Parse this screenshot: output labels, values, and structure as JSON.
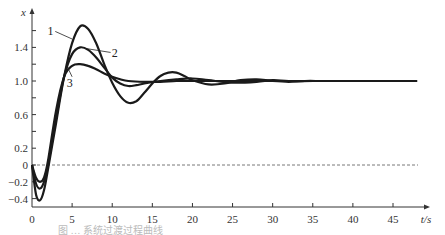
{
  "chart_data": {
    "type": "line",
    "title": "",
    "xlabel": "t/s",
    "ylabel": "x",
    "xlim": [
      0,
      48
    ],
    "ylim": [
      -0.5,
      1.85
    ],
    "x_ticks": [
      0,
      5,
      10,
      15,
      20,
      25,
      30,
      35,
      40,
      45
    ],
    "y_ticks": [
      -0.4,
      -0.2,
      0,
      0.2,
      0.6,
      1.0,
      1.4
    ],
    "y_tick_labels": [
      "-0.4",
      "-0.2",
      "0",
      "0.2",
      "0.6",
      "1.0",
      "1.4"
    ],
    "grid": false,
    "reference_line": {
      "y": 0,
      "style": "dashed"
    },
    "legend": "inline labels 1, 2, 3",
    "series": [
      {
        "name": "1",
        "x": [
          0,
          0.5,
          1,
          1.5,
          2,
          3,
          4,
          5,
          6,
          7,
          8,
          9,
          10,
          11,
          12,
          13,
          14,
          15,
          16,
          17,
          18,
          19,
          20,
          22,
          24,
          26,
          28,
          30,
          32,
          34,
          36,
          38,
          40,
          45,
          48
        ],
        "values": [
          0,
          -0.35,
          -0.42,
          -0.3,
          -0.05,
          0.5,
          1.05,
          1.45,
          1.65,
          1.62,
          1.45,
          1.2,
          0.98,
          0.82,
          0.74,
          0.76,
          0.86,
          0.97,
          1.06,
          1.1,
          1.1,
          1.06,
          1.01,
          0.96,
          0.97,
          1.01,
          1.02,
          1.0,
          0.99,
          1.0,
          1.0,
          1.0,
          1.0,
          1.0,
          1.0
        ]
      },
      {
        "name": "2",
        "x": [
          0,
          0.5,
          1,
          1.5,
          2,
          3,
          4,
          5,
          6,
          7,
          8,
          9,
          10,
          11,
          12,
          13,
          14,
          16,
          18,
          20,
          22,
          25,
          28,
          30,
          32,
          35,
          40,
          45,
          48
        ],
        "values": [
          0,
          -0.22,
          -0.28,
          -0.2,
          0.0,
          0.55,
          1.05,
          1.32,
          1.4,
          1.37,
          1.28,
          1.16,
          1.04,
          0.97,
          0.94,
          0.95,
          0.97,
          1.0,
          1.02,
          1.03,
          1.01,
          0.98,
          0.99,
          1.01,
          1.0,
          1.0,
          1.0,
          1.0,
          1.0
        ]
      },
      {
        "name": "3",
        "x": [
          0,
          0.5,
          1,
          1.5,
          2,
          3,
          4,
          5,
          6,
          7,
          8,
          9,
          10,
          11,
          12,
          14,
          16,
          18,
          20,
          22,
          25,
          30,
          35,
          40,
          45,
          48
        ],
        "values": [
          0,
          -0.15,
          -0.2,
          -0.15,
          0.05,
          0.65,
          1.05,
          1.18,
          1.2,
          1.18,
          1.14,
          1.09,
          1.05,
          1.02,
          1.0,
          0.99,
          0.99,
          1.0,
          1.0,
          1.0,
          1.0,
          1.0,
          1.0,
          1.0,
          1.0,
          1.0
        ]
      }
    ],
    "annotations": [
      {
        "text": "1",
        "x": 2.3,
        "y": 1.6
      },
      {
        "text": "2",
        "x": 10.3,
        "y": 1.33
      },
      {
        "text": "3",
        "x": 4.7,
        "y": 0.98
      }
    ]
  },
  "axes": {
    "x_label": "t/s",
    "y_label": "x",
    "zero_line": "dashed"
  },
  "caption": {
    "text": "图 … 系统过渡过程曲线"
  }
}
